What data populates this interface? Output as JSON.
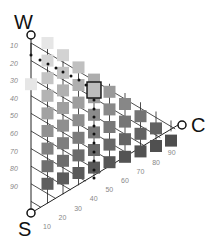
{
  "diagram": {
    "vertices": {
      "W": {
        "label": "W",
        "x": 31,
        "y": 35
      },
      "S": {
        "label": "S",
        "x": 31,
        "y": 213
      },
      "C": {
        "label": "C",
        "x": 182,
        "y": 125
      }
    },
    "left_ticks": [
      "10",
      "20",
      "30",
      "40",
      "50",
      "60",
      "70",
      "80",
      "90"
    ],
    "bottom_ticks": [
      "10",
      "20",
      "30",
      "40",
      "50",
      "60",
      "70",
      "80",
      "90"
    ],
    "highlight": {
      "column": 4,
      "row": 3
    }
  },
  "colors": {
    "line": "#222222",
    "dot": "#111111"
  }
}
